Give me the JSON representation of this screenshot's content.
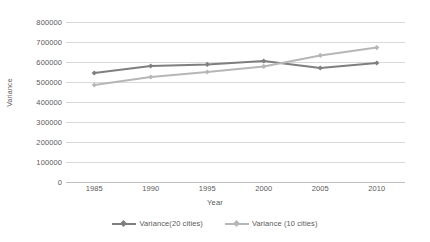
{
  "chart_data": {
    "type": "line",
    "title": "",
    "xlabel": "Year",
    "ylabel": "Variance",
    "categories": [
      "1985",
      "1990",
      "1995",
      "2000",
      "2005",
      "2010"
    ],
    "x": [
      1985,
      1990,
      1995,
      2000,
      2005,
      2010
    ],
    "ylim": [
      0,
      800000
    ],
    "yticks": [
      "0",
      "100000",
      "200000",
      "300000",
      "400000",
      "500000",
      "600000",
      "700000",
      "800000"
    ],
    "ytick_values": [
      0,
      100000,
      200000,
      300000,
      400000,
      500000,
      600000,
      700000,
      800000
    ],
    "grid": true,
    "legend_position": "bottom",
    "series": [
      {
        "name": "Variance(20 cities)",
        "color": "#7f7f7f",
        "marker": "diamond",
        "values": [
          545000,
          580000,
          588000,
          605000,
          570000,
          595000
        ]
      },
      {
        "name": "Variance (10 cities)",
        "color": "#b7b7b7",
        "marker": "diamond",
        "values": [
          485000,
          525000,
          550000,
          578000,
          633000,
          672000
        ]
      }
    ]
  },
  "colors": {
    "gridline": "#d9d9d9",
    "axis": "#bfbfbf",
    "text": "#5a5a5a",
    "background": "#ffffff"
  }
}
